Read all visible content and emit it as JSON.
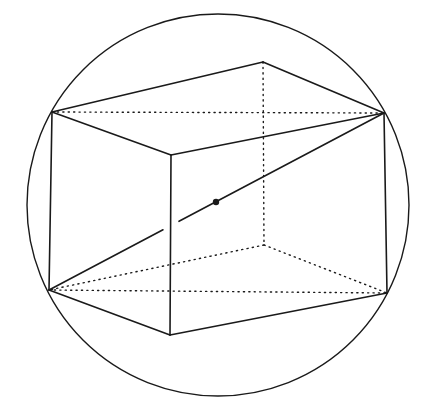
{
  "diagram": {
    "colors": {
      "stroke": "#1a1a1a",
      "background": "#ffffff"
    },
    "sphere": {
      "cx": 218,
      "cy": 205,
      "r": 191
    },
    "vertices": {
      "top_back": [
        263,
        62
      ],
      "top_left": [
        52,
        112
      ],
      "top_right": [
        384,
        113
      ],
      "top_front": [
        171,
        155
      ],
      "bottom_left": [
        49,
        290
      ],
      "bottom_front": [
        170,
        335
      ],
      "bottom_right": [
        387,
        293
      ],
      "bottom_back": [
        264,
        245
      ]
    },
    "center_point": [
      216,
      202
    ],
    "solid_edges": [
      [
        "top_left",
        "top_back"
      ],
      [
        "top_back",
        "top_right"
      ],
      [
        "top_left",
        "top_front"
      ],
      [
        "top_front",
        "top_right"
      ],
      [
        "top_left",
        "bottom_left"
      ],
      [
        "top_front",
        "bottom_front"
      ],
      [
        "top_right",
        "bottom_right"
      ],
      [
        "bottom_left",
        "bottom_front"
      ],
      [
        "bottom_front",
        "bottom_right"
      ]
    ],
    "hidden_edges": [
      [
        "top_back",
        "bottom_back"
      ],
      [
        "bottom_back",
        "bottom_left"
      ],
      [
        "bottom_back",
        "bottom_right"
      ],
      [
        "top_left",
        "top_right"
      ],
      [
        "bottom_left",
        "bottom_right"
      ]
    ],
    "space_diagonal": {
      "from": "bottom_left",
      "to": "top_right",
      "gap_x": [
        163,
        179
      ]
    }
  }
}
